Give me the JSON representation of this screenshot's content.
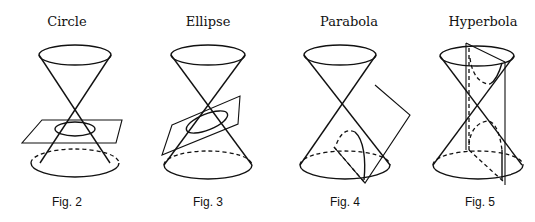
{
  "figures": [
    {
      "title": "Circle",
      "caption": "Fig. 2",
      "section": "circle"
    },
    {
      "title": "Ellipse",
      "caption": "Fig. 3",
      "section": "ellipse"
    },
    {
      "title": "Parabola",
      "caption": "Fig. 4",
      "section": "parabola"
    },
    {
      "title": "Hyperbola",
      "caption": "Fig. 5",
      "section": "hyperbola"
    }
  ]
}
